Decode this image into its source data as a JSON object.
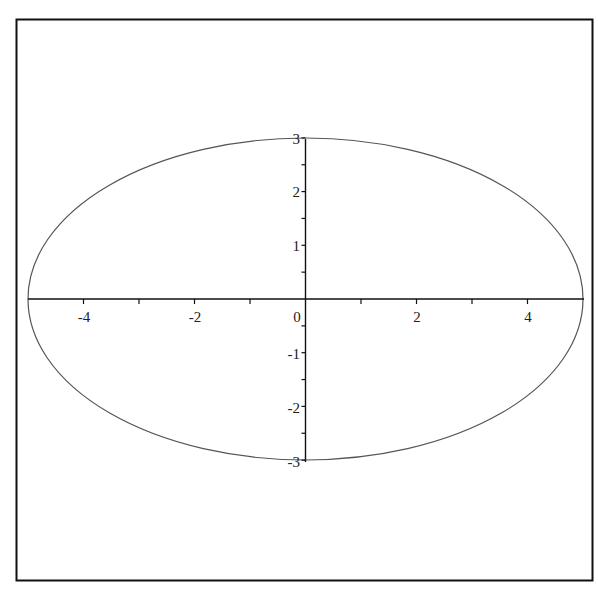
{
  "chart_data": {
    "type": "line",
    "title": "",
    "xlabel": "",
    "ylabel": "",
    "equation": "x^2/25 + y^2/9 = 1",
    "series": [
      {
        "name": "ellipse",
        "semi_major_x": 5,
        "semi_minor_y": 3,
        "center": [
          0,
          0
        ]
      }
    ],
    "xlim": [
      -5,
      5
    ],
    "ylim": [
      -3,
      3
    ],
    "x_ticks": [
      -4,
      -3,
      -2,
      -1,
      0,
      1,
      2,
      3,
      4
    ],
    "x_tick_labels": [
      "-4",
      "-2",
      "0",
      "2",
      "4"
    ],
    "y_ticks": [
      -3,
      -2.5,
      -2,
      -1.5,
      -1,
      -0.5,
      0,
      0.5,
      1,
      1.5,
      2,
      2.5,
      3
    ],
    "y_tick_labels": [
      "3",
      "2",
      "1",
      "-1",
      "-2",
      "-3"
    ],
    "grid": false,
    "legend": null,
    "colors": {
      "curve": "#555555",
      "axes": "#111111",
      "frame": "#111111"
    }
  },
  "labels": {
    "x": [
      {
        "text": "-4",
        "value": -4
      },
      {
        "text": "-2",
        "value": -2
      },
      {
        "text": "0",
        "value": 0
      },
      {
        "text": "2",
        "value": 2
      },
      {
        "text": "4",
        "value": 4
      }
    ],
    "y": [
      {
        "text": "3",
        "value": 3
      },
      {
        "text": "2",
        "value": 2
      },
      {
        "text": "1",
        "value": 1
      },
      {
        "text": "-1",
        "value": -1
      },
      {
        "text": "-2",
        "value": -2
      },
      {
        "text": "-3",
        "value": -3
      }
    ]
  }
}
